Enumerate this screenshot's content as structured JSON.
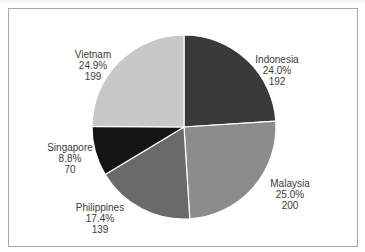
{
  "chart_data": {
    "type": "pie",
    "title": "",
    "start_angle": "12 o'clock",
    "direction": "clockwise",
    "categories": [
      "Indonesia",
      "Malaysia",
      "Philippines",
      "Singapore",
      "Vietnam"
    ],
    "values": [
      192,
      200,
      139,
      70,
      199
    ],
    "percentages": [
      "24.0%",
      "25.0%",
      "17.4%",
      "8.8%",
      "24.9%"
    ],
    "total": 800,
    "colors": [
      "#3a3a3a",
      "#8c8c8c",
      "#6a6a6a",
      "#151515",
      "#c8c8c8"
    ],
    "legend": "none (labels outside slices)",
    "slices": [
      {
        "name": "Indonesia",
        "value": "192",
        "pct": "24.0%",
        "color": "#3a3a3a"
      },
      {
        "name": "Malaysia",
        "value": "200",
        "pct": "25.0%",
        "color": "#8c8c8c"
      },
      {
        "name": "Philippines",
        "value": "139",
        "pct": "17.4%",
        "color": "#6a6a6a"
      },
      {
        "name": "Singapore",
        "value": "70",
        "pct": "8.8%",
        "color": "#151515"
      },
      {
        "name": "Vietnam",
        "value": "199",
        "pct": "24.9%",
        "color": "#c8c8c8"
      }
    ]
  }
}
